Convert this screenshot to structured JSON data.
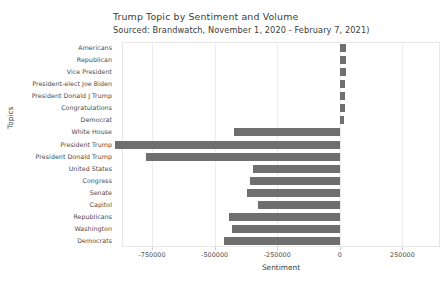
{
  "chart_data": {
    "type": "bar",
    "orientation": "horizontal",
    "title": "Trump Topic by Sentiment and Volume",
    "subtitle": "Sourced: Brandwatch, November 1, 2020 - February 7, 2021)",
    "xlabel": "Sentiment",
    "ylabel": "Topics",
    "grid": true,
    "legend": null,
    "xlim": [
      -870000,
      400000
    ],
    "xticks": [
      -750000,
      -500000,
      -250000,
      0,
      250000
    ],
    "xtick_labels": [
      "-750000",
      "-500000",
      "-250000",
      "0",
      "250000"
    ],
    "bar_color": "#6f6f6f",
    "categories": [
      "Americans",
      "Republican",
      "Vice President",
      "President-elect Joe Biden",
      "President Donald J Trump",
      "Congratulations",
      "Democrat",
      "White House",
      "President Trump",
      "President Donald Trump",
      "United States",
      "Congress",
      "Senate",
      "Capitol",
      "Republicans",
      "Washington",
      "Democrats"
    ],
    "values": [
      26000,
      25000,
      24000,
      22000,
      21000,
      20000,
      18000,
      -422000,
      -900000,
      -775000,
      -348000,
      -360000,
      -370000,
      -328000,
      -443000,
      -430000,
      -463000
    ]
  }
}
